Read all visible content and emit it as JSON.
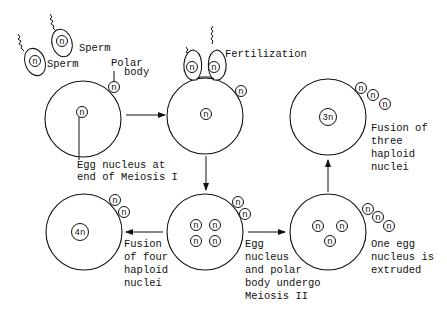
{
  "diagram": {
    "title": "",
    "labels": {
      "sperm_1": "Sperm",
      "sperm_2": "Sperm",
      "polar_body_line1": "Polar",
      "polar_body_line2": "body",
      "fertilization": "Fertilization",
      "egg_nucleus_line1": "Egg nucleus at",
      "egg_nucleus_line2": "end of Meiosis I",
      "fusion_three": [
        "Fusion of",
        "three",
        "haploid",
        "nuclei"
      ],
      "fusion_four": [
        "Fusion",
        "of four",
        "haploid",
        "nuclei"
      ],
      "meiosis_ii": [
        "Egg",
        "nucleus",
        "and polar",
        "body undergo",
        "Meiosis II"
      ],
      "extruded": [
        "One egg",
        "nucleus is",
        "extruded"
      ]
    },
    "nucleus_labels": {
      "haploid": "n",
      "triploid": "3n",
      "tetraploid": "4n"
    },
    "stages": [
      {
        "id": "egg-end-meiosis-1",
        "nuclei": [
          "n"
        ],
        "polar_bodies": 1
      },
      {
        "id": "fertilization",
        "nuclei": [
          "n"
        ],
        "polar_bodies": 1,
        "sperm_attached": 2
      },
      {
        "id": "meiosis-2",
        "nuclei": [
          "n",
          "n",
          "n",
          "n"
        ],
        "polar_bodies": 2
      },
      {
        "id": "fusion-four",
        "nuclei": [
          "4n"
        ],
        "polar_bodies": 2
      },
      {
        "id": "extrusion",
        "nuclei": [
          "n",
          "n",
          "n"
        ],
        "polar_bodies": 3
      },
      {
        "id": "fusion-three",
        "nuclei": [
          "3n"
        ],
        "polar_bodies": 3
      }
    ],
    "flow": [
      "egg-end-meiosis-1 -> fertilization",
      "fertilization -> meiosis-2",
      "meiosis-2 -> fusion-four",
      "meiosis-2 -> extrusion",
      "extrusion -> fusion-three"
    ]
  }
}
